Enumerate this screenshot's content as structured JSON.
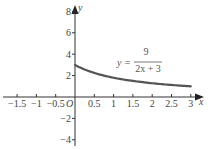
{
  "chart_data": {
    "type": "line",
    "title": "",
    "xlabel": "x",
    "ylabel": "y",
    "origin_label": "O",
    "xlim": [
      -1.8,
      3.25
    ],
    "ylim": [
      -5,
      9
    ],
    "grid": false,
    "legend": null,
    "x_ticks": [
      -1.5,
      -1,
      -0.5,
      0.5,
      1,
      1.5,
      2,
      2.5,
      3
    ],
    "x_tick_labels": [
      "−1.5",
      "−1",
      "−0.5",
      "0.5",
      "1",
      "1.5",
      "2",
      "2.5",
      "3"
    ],
    "y_ticks": [
      8,
      6,
      4,
      2,
      -2,
      -4
    ],
    "y_tick_labels": [
      "8",
      "6",
      "4",
      "2",
      "−2",
      "−4"
    ],
    "annotation": {
      "lhs": "y =",
      "numerator": "9",
      "denominator": "2x + 3"
    },
    "series": [
      {
        "name": "y = 9/(2x+3)",
        "color": "#555555",
        "x": [
          0,
          0.25,
          0.5,
          0.75,
          1,
          1.25,
          1.5,
          1.75,
          2,
          2.25,
          2.5,
          2.75,
          3
        ],
        "y": [
          3,
          2.57,
          2.25,
          2,
          1.8,
          1.64,
          1.5,
          1.38,
          1.29,
          1.2,
          1.125,
          1.06,
          1
        ]
      }
    ]
  }
}
